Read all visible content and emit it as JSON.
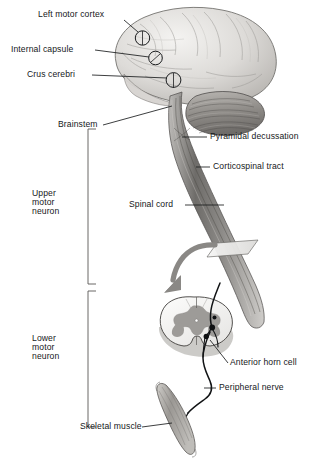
{
  "figure": {
    "background_color": "#ffffff",
    "text_color": "#16181a",
    "line_color": "#1a1c1e",
    "palette": {
      "brain_light": "#e8e6e3",
      "brain_mid": "#c9c6c2",
      "brain_dark": "#9a9793",
      "cerebellum": "#8f8c88",
      "tract_dark": "#6f6d6a",
      "tract_light": "#c2c0bd",
      "gray_matter": "#9d9b98",
      "white_matter": "#f2f1ef",
      "arrow_gray": "#8a8885",
      "muscle_gray": "#a3a09c"
    }
  },
  "labels": {
    "left_motor_cortex": "Left motor cortex",
    "internal_capsule": "Internal capsule",
    "crus_cerebri": "Crus cerebri",
    "brainstem": "Brainstem",
    "pyramidal_decussation": "Pyramidal decussation",
    "corticospinal_tract": "Corticospinal tract",
    "spinal_cord": "Spinal cord",
    "anterior_horn_cell": "Anterior horn cell",
    "peripheral_nerve": "Peripheral nerve",
    "skeletal_muscle": "Skeletal muscle"
  },
  "brackets": {
    "upper": {
      "label": "Upper motor neuron",
      "line1": "Upper",
      "line2": "motor",
      "line3": "neuron"
    },
    "lower": {
      "label": "Lower motor neuron",
      "line1": "Lower",
      "line2": "motor",
      "line3": "neuron"
    }
  },
  "structures": {
    "cerebrum": "cerebrum",
    "cerebellum": "cerebellum",
    "brainstem": "brainstem",
    "spinal_cord_section": "spinal-cord-cross-section",
    "section_plane": "section-plane-marker",
    "transition_arrow": "transition-arrow",
    "muscle": "skeletal-muscle",
    "nerve_fiber": "nerve-fiber",
    "cortex_marker": "cortex-circle-marker",
    "capsule_marker": "internal-capsule-circle-marker",
    "crus_marker": "crus-cerebri-circle-marker"
  }
}
